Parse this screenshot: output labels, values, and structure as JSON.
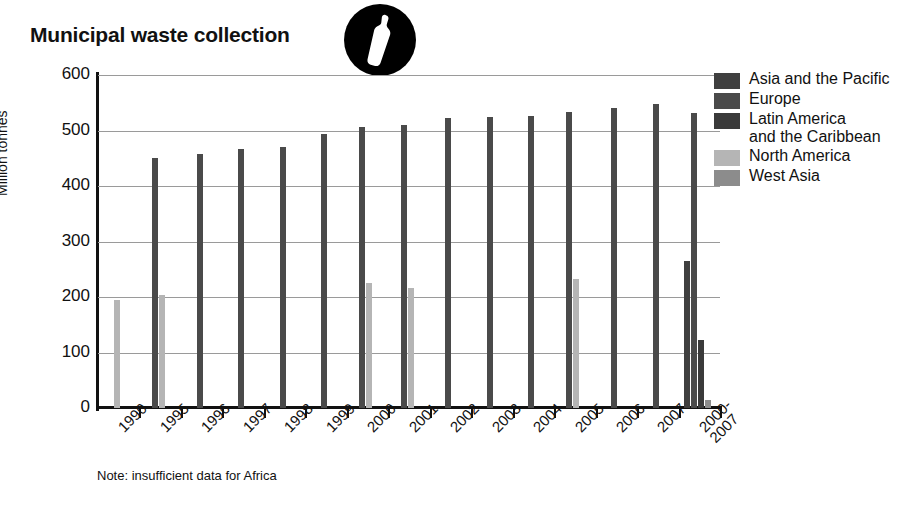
{
  "title": "Municipal waste collection",
  "badge_icon": "bottle-in-circle-icon",
  "note": "Note: insufficient data for Africa",
  "legend": {
    "items": [
      {
        "label": "Asia and the Pacific",
        "color": "#3f3f3f"
      },
      {
        "label": "Europe",
        "color": "#4a4a4a"
      },
      {
        "label": "Latin America\nand the Caribbean",
        "color": "#3a3a3a"
      },
      {
        "label": "North America",
        "color": "#b5b5b5"
      },
      {
        "label": "West Asia",
        "color": "#8c8c8c"
      }
    ]
  },
  "axis": {
    "y_label": "Million tonnes",
    "y_ticks": [
      "0",
      "100",
      "200",
      "300",
      "400",
      "500",
      "600"
    ]
  },
  "chart_data": {
    "type": "bar",
    "title": "Municipal waste collection",
    "xlabel": "",
    "ylabel": "Million tonnes",
    "ylim": [
      0,
      600
    ],
    "ytick_step": 100,
    "grid": true,
    "legend_position": "right",
    "note": "Note: insufficient data for Africa",
    "categories": [
      "1990",
      "1995",
      "1996",
      "1997",
      "1998",
      "1999",
      "2000",
      "2001",
      "2002",
      "2003",
      "2004",
      "2005",
      "2006",
      "2007",
      "2000-\n2007"
    ],
    "series": [
      {
        "name": "Asia and the Pacific",
        "color": "#3f3f3f",
        "values": [
          null,
          null,
          null,
          null,
          null,
          null,
          null,
          null,
          null,
          null,
          null,
          null,
          null,
          null,
          265
        ]
      },
      {
        "name": "Europe",
        "color": "#4a4a4a",
        "values": [
          null,
          450,
          458,
          467,
          471,
          494,
          507,
          510,
          523,
          525,
          526,
          534,
          541,
          547,
          531
        ]
      },
      {
        "name": "Latin America and the Caribbean",
        "color": "#3a3a3a",
        "values": [
          null,
          null,
          null,
          null,
          null,
          null,
          null,
          null,
          null,
          null,
          null,
          null,
          null,
          null,
          123
        ]
      },
      {
        "name": "North America",
        "color": "#b5b5b5",
        "values": [
          195,
          203,
          null,
          null,
          null,
          null,
          226,
          217,
          null,
          null,
          null,
          232,
          null,
          null,
          null
        ]
      },
      {
        "name": "West Asia",
        "color": "#8c8c8c",
        "values": [
          null,
          null,
          null,
          null,
          null,
          null,
          null,
          null,
          null,
          null,
          null,
          null,
          null,
          null,
          15
        ]
      }
    ]
  }
}
